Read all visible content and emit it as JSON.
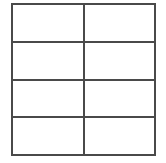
{
  "figure": {
    "type": "grid",
    "title": "",
    "background_color": "#ffffff",
    "line_color": "#4a4a4a",
    "line_width_px": 2,
    "columns": 2,
    "rows": 4,
    "bounds": {
      "left_px": 11,
      "top_px": 3,
      "width_px": 145,
      "height_px": 151
    }
  },
  "grid": {
    "column_headers": [
      "",
      ""
    ],
    "rows": [
      {
        "cells": [
          "",
          ""
        ]
      },
      {
        "cells": [
          "",
          ""
        ]
      },
      {
        "cells": [
          "",
          ""
        ]
      },
      {
        "cells": [
          "",
          ""
        ]
      }
    ]
  }
}
